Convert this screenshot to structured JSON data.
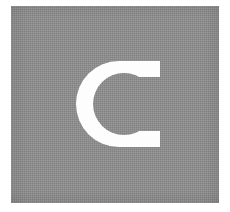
{
  "image": {
    "kind": "logo-mark",
    "description": "Square gray plate with a white capital letter C",
    "width": 230,
    "height": 212,
    "background_color": "#ffffff"
  },
  "plate": {
    "name": "gray-square",
    "fill_color": "#8d8d8d",
    "x": 11,
    "y": 6,
    "width": 208,
    "height": 197,
    "texture": "dithered-halftone"
  },
  "glyph": {
    "name": "letter-c",
    "character": "C",
    "fill_color": "#fdfdfd",
    "x": 77,
    "y": 44,
    "width": 83,
    "height": 121,
    "outer_center_x": 119,
    "outer_center_y": 104,
    "outer_radius": 43,
    "inner_center_x": 124,
    "inner_center_y": 104,
    "inner_radius": 31
  }
}
